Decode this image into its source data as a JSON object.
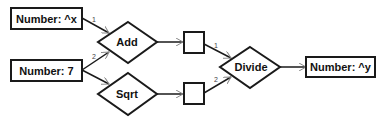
{
  "diagram": {
    "nodes": {
      "input_x": {
        "label": "Number: ^x",
        "type": "rect"
      },
      "input_7": {
        "label": "Number: 7",
        "type": "rect"
      },
      "add": {
        "label": "Add",
        "type": "diamond"
      },
      "sqrt": {
        "label": "Sqrt",
        "type": "diamond"
      },
      "result_add": {
        "label": "",
        "type": "rect"
      },
      "result_sqrt": {
        "label": "",
        "type": "rect"
      },
      "divide": {
        "label": "Divide",
        "type": "diamond"
      },
      "output_y": {
        "label": "Number: ^y",
        "type": "rect"
      }
    },
    "edges": [
      {
        "from": "input_x",
        "to": "add",
        "port": "1"
      },
      {
        "from": "input_7",
        "to": "add",
        "port": "2"
      },
      {
        "from": "input_7",
        "to": "sqrt",
        "port": ""
      },
      {
        "from": "add",
        "to": "result_add",
        "port": ""
      },
      {
        "from": "sqrt",
        "to": "result_sqrt",
        "port": ""
      },
      {
        "from": "result_add",
        "to": "divide",
        "port": "1"
      },
      {
        "from": "result_sqrt",
        "to": "divide",
        "port": "2"
      },
      {
        "from": "divide",
        "to": "output_y",
        "port": ""
      }
    ],
    "port_labels": {
      "add_in1": "1",
      "add_in2": "2",
      "divide_in1": "1",
      "divide_in2": "2"
    }
  }
}
